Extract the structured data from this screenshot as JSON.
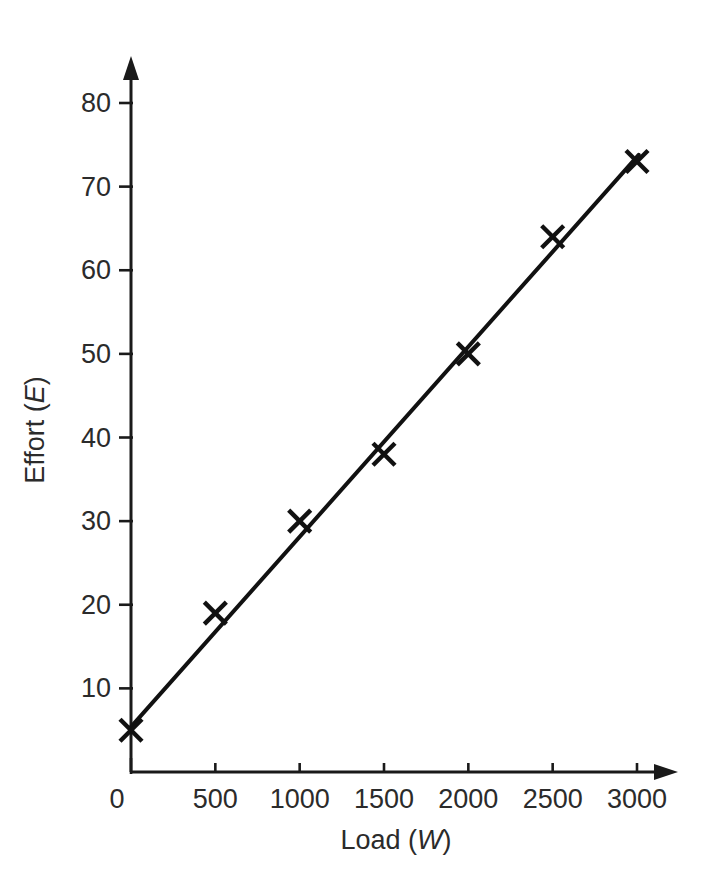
{
  "chart_data": {
    "type": "scatter",
    "title": "",
    "subtitle": "",
    "xlabel": "Load (W)",
    "xlabel_plain": "Load",
    "xlabel_symbol": "W",
    "ylabel": "Effort (E)",
    "ylabel_plain": "Effort",
    "ylabel_symbol": "E",
    "xlim": [
      0,
      3200
    ],
    "ylim": [
      0,
      85
    ],
    "grid": false,
    "legend": "none",
    "x_ticks": [
      0,
      500,
      1000,
      1500,
      2000,
      2500,
      3000
    ],
    "x_tick_labels": [
      "0",
      "500",
      "1000",
      "1500",
      "2000",
      "2500",
      "3000"
    ],
    "y_ticks": [
      10,
      20,
      30,
      40,
      50,
      60,
      70,
      80
    ],
    "y_tick_labels": [
      "10",
      "20",
      "30",
      "40",
      "50",
      "60",
      "70",
      "80"
    ],
    "origin_label": "0",
    "series": [
      {
        "name": "Effort vs Load",
        "marker": "cross",
        "x": [
          0,
          500,
          1000,
          1500,
          2000,
          2500,
          3000
        ],
        "values": [
          5,
          19,
          30,
          38,
          50,
          64,
          73
        ]
      }
    ],
    "trend_line": {
      "name": "line of best fit",
      "x_start": 0,
      "y_start": 5.4,
      "x_end": 3010,
      "y_end": 73.8
    },
    "marker_color": "#111111",
    "line_color": "#111111",
    "axis_color": "#1a1a1a",
    "background_color": "#ffffff"
  }
}
